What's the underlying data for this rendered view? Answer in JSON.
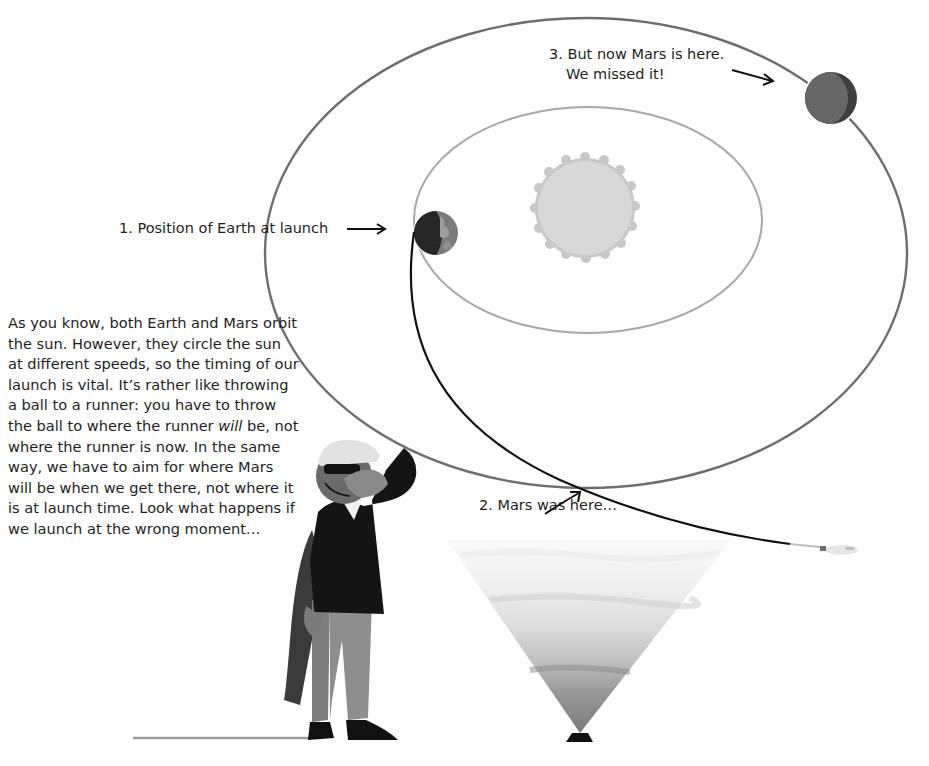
{
  "diagram": {
    "body_text": {
      "part1": "As you know, both Earth and Mars orbit the sun. However, they circle the sun at different speeds, so the timing of our launch is vital. It’s rather like throwing a ball to a runner: you have to throw the ball to where the runner ",
      "emphasis": "will",
      "part2": " be, not where the runner is now. In the same way, we have to aim for where Mars will be when we get there, not where it is at launch time. Look what happens if we launch at the wrong moment…"
    },
    "labels": {
      "earth_launch": "1. Position of Earth at launch",
      "mars_was": "2. Mars was here…",
      "mars_now_line1": "3.  But now Mars is here.",
      "mars_now_line2": "We missed it!"
    },
    "bodies": [
      {
        "name": "Sun",
        "center": [
          585,
          208
        ],
        "radius": 48
      },
      {
        "name": "Earth",
        "center": [
          436,
          233
        ],
        "radius": 22
      },
      {
        "name": "Mars",
        "center": [
          831,
          98
        ],
        "radius": 26
      }
    ],
    "orbits": [
      {
        "name": "Earth orbit",
        "center": [
          588,
          220
        ],
        "rx": 174,
        "ry": 113
      },
      {
        "name": "Mars orbit",
        "center": [
          586,
          253
        ],
        "rx": 321,
        "ry": 235
      }
    ],
    "colors": {
      "background": "#ffffff",
      "mars_orbit": "#6e6e6e",
      "earth_orbit": "#a8a8a8",
      "sun_fill": "#d6d6d6",
      "sun_edge": "#c4c4c4",
      "trajectory": "#111111",
      "earth_dark": "#262626",
      "earth_light": "#7a7a7a",
      "mars_fill": "#666666",
      "mars_shade": "#3e3e3e",
      "text": "#1e1e1e"
    }
  }
}
